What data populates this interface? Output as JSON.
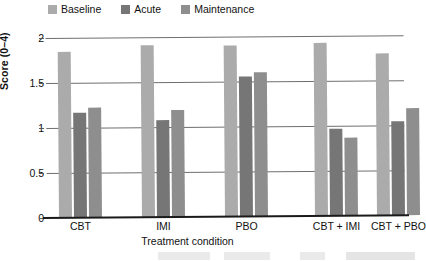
{
  "chart_data": {
    "type": "bar",
    "title": "",
    "xlabel": "Treatment condition",
    "ylabel": "Score (0–4)",
    "ylim": [
      0,
      2
    ],
    "yticks": [
      "0",
      "0.5",
      "1",
      "1.5",
      "2"
    ],
    "ytick_values": [
      0,
      0.5,
      1,
      1.5,
      2
    ],
    "grid": true,
    "legend_position": "top-left",
    "categories": [
      "CBT",
      "IMI",
      "PBO",
      "CBT + IMI",
      "CBT + PBO"
    ],
    "series": [
      {
        "name": "Baseline",
        "color": "#ababab",
        "values": [
          1.85,
          1.91,
          1.9,
          1.92,
          1.8
        ]
      },
      {
        "name": "Acute",
        "color": "#767676",
        "values": [
          1.17,
          1.08,
          1.56,
          0.97,
          1.04
        ]
      },
      {
        "name": "Maintenance",
        "color": "#8e8e8e",
        "values": [
          1.22,
          1.19,
          1.6,
          0.87,
          1.19
        ]
      }
    ]
  },
  "legend": {
    "items": [
      {
        "label": "Baseline",
        "color": "#ababab"
      },
      {
        "label": "Acute",
        "color": "#767676"
      },
      {
        "label": "Maintenance",
        "color": "#8e8e8e"
      }
    ]
  },
  "axes": {
    "y_title": "Score (0–4)",
    "x_title": "Treatment condition",
    "y_tick_labels": [
      "2",
      "1.5",
      "1",
      "0.5",
      "0"
    ],
    "x_tick_labels": [
      "CBT",
      "IMI",
      "PBO",
      "CBT + IMI",
      "CBT + PBO"
    ]
  }
}
